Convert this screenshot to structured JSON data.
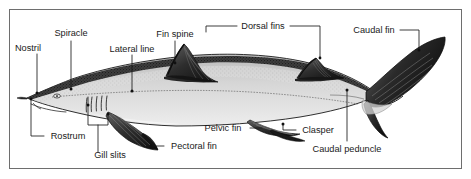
{
  "figure": {
    "kind": "anatomical-diagram",
    "frame_color": "#6e6e6e",
    "background_color": "#ffffff",
    "ink_color": "#1a1a1a",
    "body_fill": "#d9d9d9",
    "dorsal_shade": "#2b2b2b",
    "fin_shade": "#4a4a4a"
  },
  "labels": {
    "nostril": "Nostril",
    "spiracle": "Spiracle",
    "lateral_line": "Lateral line",
    "fin_spine": "Fin spine",
    "dorsal_fins": "Dorsal fins",
    "caudal_fin": "Caudal fin",
    "rostrum": "Rostrum",
    "gill_slits": "Gill slits",
    "pectoral_fin": "Pectoral fin",
    "pelvic_fin": "Pelvic fin",
    "clasper": "Clasper",
    "caudal_peduncle": "Caudal peduncle"
  }
}
